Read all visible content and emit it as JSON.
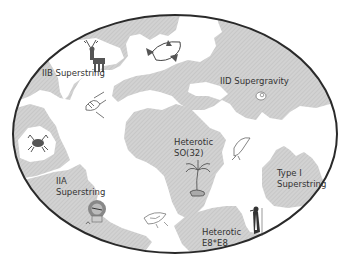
{
  "diagram": {
    "type": "world-map-metaphor",
    "frame_shape": "ellipse",
    "colors": {
      "background": "#ffffff",
      "ocean": "#ffffff",
      "land": "#cfcfcf",
      "land_hatch": "#bdbdbd",
      "outline": "#2a2a2a",
      "text": "#333333",
      "icon": "#555555"
    },
    "regions": [
      {
        "id": "iib",
        "label": "IIB Superstring",
        "icon": "deer-icon"
      },
      {
        "id": "iid",
        "label": "IID Supergravity",
        "icon": "snail-shell-icon"
      },
      {
        "id": "so32",
        "label_line1": "Heterotic",
        "label_line2": "SO(32)",
        "icon": "palm-tree-icon"
      },
      {
        "id": "iia",
        "label_line1": "IIA",
        "label_line2": "Superstring",
        "icon": "lion-icon"
      },
      {
        "id": "type1",
        "label_line1": "Type I",
        "label_line2": "Superstring",
        "icon": null
      },
      {
        "id": "e8e8",
        "label_line1": "Heterotic",
        "label_line2": "E8*E8",
        "icon": "penguin-icon"
      }
    ],
    "ocean_icons": [
      "shark-icon",
      "angelfish-icon",
      "crab-icon",
      "dolphin-icon",
      "fish-icon"
    ]
  }
}
